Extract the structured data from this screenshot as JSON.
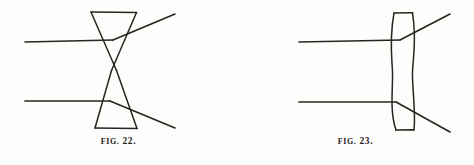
{
  "page": {
    "background_color": "#fdfdfb",
    "ink_color": "#2a2420",
    "width": 474,
    "height": 165,
    "kind": "scanned-book-illustration"
  },
  "figures": [
    {
      "id": "fig-22",
      "caption_word": "Fig.",
      "caption_number": "22.",
      "caption_full": "FIG. 22.",
      "subject": "double-cone (biconcave) lens with refracted light rays",
      "lens": {
        "type": "double-cone",
        "top_edge": {
          "x1": 91,
          "y1": 12,
          "x2": 136,
          "y2": 12
        },
        "bottom_edge": {
          "x1": 95,
          "y1": 128,
          "x2": 137,
          "y2": 128
        },
        "waist": {
          "x": 114,
          "y": 70
        },
        "left_upper": {
          "x1": 91,
          "y1": 12,
          "x2": 116,
          "y2": 70
        },
        "right_upper": {
          "x1": 136,
          "y1": 12,
          "x2": 112,
          "y2": 70
        },
        "left_lower": {
          "x1": 112,
          "y1": 70,
          "x2": 95,
          "y2": 128
        },
        "right_lower": {
          "x1": 116,
          "y1": 70,
          "x2": 137,
          "y2": 128
        }
      },
      "rays": [
        {
          "name": "upper-incident-ray",
          "points": "25,42 113,40",
          "description": "horizontal ray entering from the left, upper"
        },
        {
          "name": "upper-refracted-ray",
          "points": "113,40 175,14",
          "description": "ray bending upward after the lens"
        },
        {
          "name": "lower-incident-ray",
          "points": "25,101 110,101",
          "description": "horizontal ray entering from the left, lower"
        },
        {
          "name": "lower-refracted-ray",
          "points": "110,101 175,128",
          "description": "ray bending downward after the lens"
        }
      ]
    },
    {
      "id": "fig-23",
      "caption_word": "Fig.",
      "caption_number": "23.",
      "caption_full": "FIG. 23.",
      "subject": "biconcave lens with curved faces and refracted light rays",
      "lens": {
        "type": "biconcave-curved",
        "top_edge": {
          "x1": 394,
          "y1": 13,
          "x2": 412,
          "y2": 13
        },
        "bottom_edge": {
          "x1": 396,
          "y1": 130,
          "x2": 414,
          "y2": 130
        },
        "waist_left_x": 392,
        "waist_right_x": 412,
        "waist_y": 72
      },
      "rays": [
        {
          "name": "upper-incident-ray",
          "points": "299,42 400,40",
          "description": "horizontal ray entering from the left, upper"
        },
        {
          "name": "upper-refracted-ray",
          "points": "400,40 450,14",
          "description": "ray bending upward after the lens"
        },
        {
          "name": "lower-incident-ray",
          "points": "299,102 396,102",
          "description": "horizontal ray entering from the left, lower"
        },
        {
          "name": "lower-refracted-ray",
          "points": "396,102 450,132",
          "description": "ray bending downward after the lens"
        }
      ]
    }
  ]
}
